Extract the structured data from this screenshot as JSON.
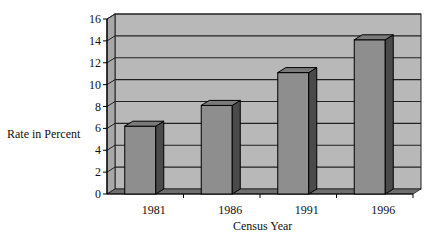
{
  "chart_data": {
    "type": "bar",
    "title": "",
    "xlabel": "Census Year",
    "ylabel": "Rate in Percent",
    "categories": [
      "1981",
      "1986",
      "1991",
      "1996"
    ],
    "values": [
      6.2,
      8.1,
      11.1,
      14.1
    ],
    "ylim": [
      0,
      16
    ],
    "yticks": [
      "0",
      "2",
      "4",
      "6",
      "8",
      "10",
      "12",
      "14",
      "16"
    ],
    "grid": true,
    "legend": "none",
    "style": "3d-column"
  },
  "colors": {
    "wall": "#b8b8b8",
    "bar_front": "#8e8e8e",
    "bar_side": "#4a4a4a",
    "bar_top": "#7a7a7a",
    "floor": "#6e6e6e",
    "grid": "#222222"
  }
}
